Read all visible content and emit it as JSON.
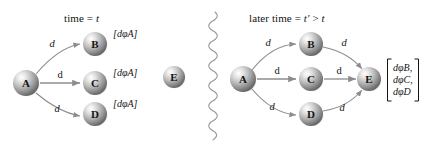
{
  "figure": {
    "background_color": "#ffffff",
    "ink_color": "#141414",
    "edge_color": "#8c8c8c",
    "sphere_color_light": "#f2f2f2",
    "sphere_color_mid": "#b4b4b4",
    "sphere_color_dark": "#6e6e6e",
    "divider": {
      "name": "squiggly-divider",
      "glyph": "wavy-vertical-line"
    }
  },
  "left_panel": {
    "title_prefix": "time = ",
    "title_variable": "t",
    "nodes": [
      {
        "id": "A",
        "label": "A",
        "cx": 26,
        "cy": 83,
        "r": 13
      },
      {
        "id": "B",
        "label": "B",
        "cx": 95,
        "cy": 44,
        "r": 12
      },
      {
        "id": "C",
        "label": "C",
        "cx": 95,
        "cy": 83,
        "r": 12
      },
      {
        "id": "D",
        "label": "D",
        "cx": 95,
        "cy": 114,
        "r": 12
      },
      {
        "id": "E",
        "label": "E",
        "cx": 174,
        "cy": 77,
        "r": 11
      }
    ],
    "edges": [
      {
        "from": "A",
        "to": "B",
        "label": "d",
        "style": "cursive"
      },
      {
        "from": "A",
        "to": "C",
        "label": "d",
        "style": "upright"
      },
      {
        "from": "A",
        "to": "D",
        "label": "d",
        "style": "cursive"
      }
    ],
    "brackets": [
      {
        "for": "B",
        "text": "[dφA]"
      },
      {
        "for": "C",
        "text": "[dφA]"
      },
      {
        "for": "D",
        "text": "[dφA]"
      }
    ]
  },
  "right_panel": {
    "title_prefix": "later time = ",
    "title_variable": "t′",
    "title_relation": " > ",
    "title_variable2": "t",
    "nodes": [
      {
        "id": "A",
        "label": "A",
        "cx": 243,
        "cy": 79,
        "r": 13
      },
      {
        "id": "B",
        "label": "B",
        "cx": 311,
        "cy": 44,
        "r": 12
      },
      {
        "id": "C",
        "label": "C",
        "cx": 311,
        "cy": 79,
        "r": 12
      },
      {
        "id": "D",
        "label": "D",
        "cx": 311,
        "cy": 114,
        "r": 12
      },
      {
        "id": "E",
        "label": "E",
        "cx": 369,
        "cy": 79,
        "r": 12
      }
    ],
    "edges": [
      {
        "from": "A",
        "to": "B",
        "label": "d",
        "style": "cursive"
      },
      {
        "from": "A",
        "to": "C",
        "label": "d",
        "style": "upright"
      },
      {
        "from": "A",
        "to": "D",
        "label": "d",
        "style": "cursive"
      },
      {
        "from": "B",
        "to": "E",
        "label": "d",
        "style": "cursive"
      },
      {
        "from": "C",
        "to": "E",
        "label": "d",
        "style": "upright"
      },
      {
        "from": "D",
        "to": "E",
        "label": "d",
        "style": "cursive"
      }
    ],
    "bracket": {
      "lines": [
        "dφB,",
        "dφC,",
        "dφD"
      ]
    }
  }
}
